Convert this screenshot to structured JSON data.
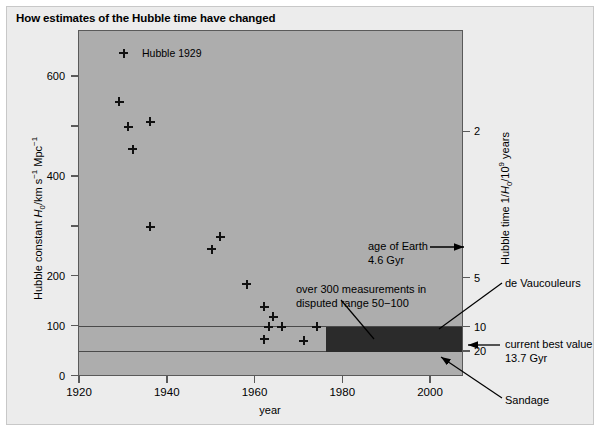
{
  "figure": {
    "title": "How estimates of the Hubble time have changed"
  },
  "chart_data": {
    "type": "scatter",
    "title": "How estimates of the Hubble time have changed",
    "xlabel": "year",
    "ylabel": "Hubble constant H0/km s-1 Mpc-1",
    "ylabel_right": "Hubble time 1/H0/10^9 years",
    "xlim": [
      1920,
      2007
    ],
    "ylim": [
      0,
      680
    ],
    "xticks": [
      1920,
      1940,
      1960,
      1980,
      2000
    ],
    "yticks_major": [
      0,
      100,
      200,
      400,
      600
    ],
    "yticks_minor": [
      300,
      500
    ],
    "yticks_right_values": [
      2,
      5,
      10,
      20
    ],
    "yticks_right_H0": [
      489,
      196,
      98,
      49
    ],
    "grid": false,
    "legend_position": "inside top-left",
    "legend": [
      {
        "marker": "plus",
        "label": "Hubble 1929"
      }
    ],
    "series": [
      {
        "name": "Hubble constant estimates",
        "marker": "plus",
        "points": [
          {
            "year": 1929,
            "H0": 550
          },
          {
            "year": 1931,
            "H0": 500
          },
          {
            "year": 1936,
            "H0": 510
          },
          {
            "year": 1932,
            "H0": 455
          },
          {
            "year": 1936,
            "H0": 300
          },
          {
            "year": 1952,
            "H0": 280
          },
          {
            "year": 1950,
            "H0": 255
          },
          {
            "year": 1958,
            "H0": 185
          },
          {
            "year": 1962,
            "H0": 140
          },
          {
            "year": 1964,
            "H0": 120
          },
          {
            "year": 1963,
            "H0": 100
          },
          {
            "year": 1966,
            "H0": 100
          },
          {
            "year": 1974,
            "H0": 100
          },
          {
            "year": 1962,
            "H0": 75
          },
          {
            "year": 1971,
            "H0": 72
          }
        ]
      }
    ],
    "bands": [
      {
        "name": "disputed range band",
        "x_start": 1976,
        "x_end": 2007,
        "y_low": 50,
        "y_high": 100,
        "color": "#2b2b2b"
      }
    ],
    "reference_lines": [
      {
        "name": "upper disputed limit",
        "y": 100
      },
      {
        "name": "lower disputed limit",
        "y": 50
      }
    ],
    "annotations": [
      {
        "name": "age-of-earth",
        "line1": "age of Earth",
        "line2": "4.6 Gyr"
      },
      {
        "name": "disputed-measurements",
        "line1": "over 300 measurements in",
        "line2": "disputed range 50−100"
      },
      {
        "name": "de-vaucouleurs",
        "line1": "de Vaucouleurs"
      },
      {
        "name": "current-best-value",
        "line1": "current best value",
        "line2": "13.7 Gyr"
      },
      {
        "name": "sandage",
        "line1": "Sandage"
      }
    ]
  },
  "axes": {
    "left": {
      "labels": [
        "600",
        "400",
        "200",
        "100",
        "0"
      ],
      "title_pre": "Hubble constant ",
      "title_var": "H",
      "title_sub": "0",
      "title_unit": "/km s",
      "title_exp1": "−1",
      "title_mid": " Mpc",
      "title_exp2": "−1"
    },
    "right": {
      "labels": [
        "2",
        "5",
        "10",
        "20"
      ],
      "title_pre": "Hubble time 1/",
      "title_var": "H",
      "title_sub": "0",
      "title_mid": "/10",
      "title_exp": "9",
      "title_post": " years"
    },
    "bottom": {
      "labels": [
        "1920",
        "1940",
        "1960",
        "1980",
        "2000"
      ],
      "title": "year"
    }
  },
  "annotations": {
    "earth": {
      "line1": "age of Earth",
      "line2": "4.6 Gyr"
    },
    "disputed": {
      "line1": "over 300 measurements in",
      "line2": "disputed range 50−100"
    },
    "devaucouleurs": {
      "label": "de Vaucouleurs"
    },
    "best_value": {
      "line1": "current best value",
      "line2": "13.7 Gyr"
    },
    "sandage": {
      "label": "Sandage"
    }
  },
  "legend": {
    "label": "Hubble 1929"
  },
  "colors": {
    "plot_background": "#adadad",
    "panel_background": "#ececec",
    "band": "#2b2b2b",
    "axis": "#5a5a5a",
    "marker": "#111111"
  }
}
